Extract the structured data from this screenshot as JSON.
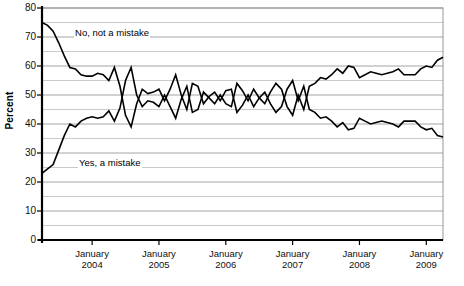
{
  "chart_data": {
    "type": "line",
    "title": "",
    "xlabel": "",
    "ylabel": "Percent",
    "ylim": [
      0,
      80
    ],
    "ytick_step": 10,
    "gridline_step": 5,
    "grid": true,
    "legend_position": "inline-annotation",
    "yticks": [
      "0",
      "10",
      "20",
      "30",
      "40",
      "50",
      "60",
      "70",
      "80"
    ],
    "xticks": [
      {
        "month": "January",
        "year": "2004"
      },
      {
        "month": "January",
        "year": "2005"
      },
      {
        "month": "January",
        "year": "2006"
      },
      {
        "month": "January",
        "year": "2007"
      },
      {
        "month": "January",
        "year": "2008"
      },
      {
        "month": "January",
        "year": "2009"
      }
    ],
    "x_range_start": "2003-04",
    "x_range_end": "2009-03",
    "series": [
      {
        "name": "No, not a mistake",
        "color": "#000000",
        "label_x_frac": 0.075,
        "label_y_value": 71.5,
        "values": [
          75.0,
          74.0,
          72.0,
          68.0,
          63.5,
          59.5,
          59.0,
          57.0,
          56.5,
          56.5,
          57.5,
          57.0,
          55.0,
          59.5,
          53.0,
          43.0,
          39.0,
          47.0,
          52.0,
          50.5,
          51.0,
          52.0,
          48.0,
          52.0,
          57.0,
          50.0,
          45.0,
          54.0,
          53.0,
          47.0,
          49.5,
          51.0,
          48.0,
          51.5,
          52.0,
          44.0,
          46.5,
          50.0,
          46.0,
          49.0,
          51.0,
          47.0,
          44.0,
          46.0,
          52.0,
          55.0,
          48.0,
          53.0,
          45.0,
          44.0,
          42.0,
          42.5,
          41.0,
          39.0,
          40.5,
          38.0,
          38.5,
          42.0,
          41.0,
          40.0,
          40.5,
          41.0,
          40.5,
          40.0,
          39.0,
          41.0,
          41.0,
          41.0,
          39.0,
          38.0,
          38.5,
          36.0,
          35.5
        ]
      },
      {
        "name": "Yes, a mistake",
        "color": "#000000",
        "label_x_frac": 0.085,
        "label_y_value": 26.5,
        "values": [
          23.0,
          24.5,
          26.0,
          31.0,
          36.0,
          40.0,
          39.0,
          41.0,
          42.0,
          42.5,
          42.0,
          42.5,
          44.5,
          41.0,
          45.5,
          55.0,
          59.5,
          50.0,
          46.0,
          48.0,
          47.5,
          46.0,
          50.0,
          46.0,
          42.0,
          48.5,
          53.0,
          44.0,
          45.0,
          51.0,
          49.0,
          47.0,
          50.0,
          47.0,
          46.0,
          54.0,
          51.5,
          48.0,
          52.0,
          49.0,
          47.0,
          51.0,
          54.0,
          52.0,
          46.0,
          43.0,
          50.0,
          45.0,
          53.0,
          54.0,
          56.0,
          55.5,
          57.0,
          59.0,
          57.5,
          60.0,
          59.5,
          56.0,
          57.0,
          58.0,
          57.5,
          57.0,
          57.5,
          58.0,
          59.0,
          57.0,
          57.0,
          57.0,
          59.0,
          60.0,
          59.5,
          62.0,
          63.0
        ]
      }
    ]
  },
  "plot_geometry": {
    "left": 42,
    "right": 443,
    "top": 8,
    "bottom": 240
  }
}
